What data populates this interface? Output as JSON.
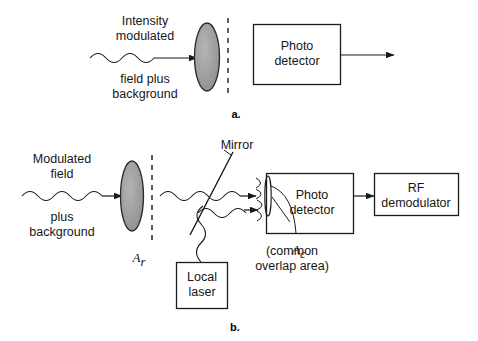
{
  "figure": {
    "background_color": "#ffffff",
    "line_color": "#1a1a1a",
    "lens_fill_color": "#9b9b9b"
  },
  "panel_a": {
    "caption": "a.",
    "input_label_top": "Intensity\nmodulated",
    "input_label_bottom": "field plus\nbackground",
    "lens": {
      "name": "receiver-lens",
      "fill": "#9b9b9b"
    },
    "aperture_divider": {
      "style": "dashed"
    },
    "detector_box": {
      "label": "Photo\ndetector"
    },
    "output_arrow": {
      "label": ""
    }
  },
  "panel_b": {
    "caption": "b.",
    "input_label_top": "Modulated\nfield",
    "input_label_bottom": "plus\nbackground",
    "lens": {
      "name": "receiver-lens",
      "fill": "#9b9b9b"
    },
    "lens_area_symbol": {
      "base": "A",
      "subscript": "r"
    },
    "aperture_divider": {
      "style": "dashed"
    },
    "mirror_label": "Mirror",
    "local_laser_box": {
      "label": "Local\nlaser"
    },
    "detector_box": {
      "label": "Photo\ndetector"
    },
    "demodulator_box": {
      "label": "RF\ndemodulator"
    },
    "overlap_symbol": {
      "base": "A",
      "subscript": "c"
    },
    "overlap_note": "(common\noverlap area)"
  }
}
